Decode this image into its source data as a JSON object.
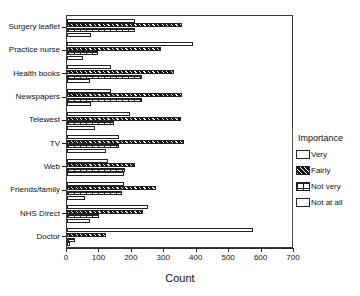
{
  "chart_data": {
    "type": "bar",
    "orientation": "horizontal",
    "title": "",
    "xlabel": "Count",
    "ylabel": "",
    "xlim": [
      0,
      700
    ],
    "xticks": [
      0,
      100,
      200,
      300,
      400,
      500,
      600,
      700
    ],
    "grid": false,
    "legend": {
      "title": "Importance",
      "position": "right",
      "entries": [
        {
          "label": "Very",
          "pattern": "open-white"
        },
        {
          "label": "Fairly",
          "pattern": "black-diagonal-hatch"
        },
        {
          "label": "Not very",
          "pattern": "crosshatch-grid"
        },
        {
          "label": "Not at all",
          "pattern": "open-white"
        }
      ]
    },
    "categories": [
      "Surgery leaflet",
      "Practice nurse",
      "Health books",
      "Newspapers",
      "Telewest",
      "TV",
      "Web",
      "Friends/family",
      "NHS  Direct",
      "Doctor"
    ],
    "series": [
      {
        "name": "Very",
        "values": [
          210,
          390,
          135,
          135,
          195,
          160,
          125,
          175,
          250,
          573
        ]
      },
      {
        "name": "Fairly",
        "values": [
          355,
          290,
          330,
          355,
          350,
          360,
          210,
          275,
          235,
          120
        ]
      },
      {
        "name": "Not very",
        "values": [
          210,
          95,
          230,
          230,
          145,
          160,
          180,
          170,
          100,
          25
        ]
      },
      {
        "name": "Not at all",
        "values": [
          75,
          50,
          70,
          75,
          85,
          120,
          175,
          55,
          70,
          10
        ]
      }
    ]
  },
  "colors": {
    "axis": "#2a2a2a",
    "frame": "#3a3a3a",
    "bar_outline": "#222222",
    "fairly_fill": "#111111",
    "background": "#ffffff"
  }
}
